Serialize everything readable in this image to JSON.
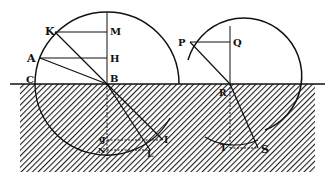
{
  "figure": {
    "colors": {
      "ink": "#111111",
      "background": "#ffffff",
      "hatch": "#222222"
    }
  },
  "labels": {
    "K": "K",
    "M": "M",
    "A": "A",
    "H": "H",
    "C": "C",
    "B": "B",
    "g": "g",
    "N": "N",
    "I": "I",
    "L": "L",
    "P": "P",
    "Q": "Q",
    "R": "R",
    "T": "T",
    "S": "S"
  }
}
